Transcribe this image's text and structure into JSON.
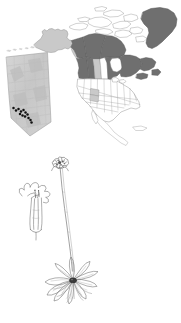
{
  "figure": {
    "background_color": "#ffffff",
    "width": 181,
    "height": 323
  },
  "map": {
    "name": "north-america-distribution-map",
    "projection_note": "North America, Greenland and Arctic archipelago outline",
    "colors": {
      "present_dark": "#6f6f6f",
      "present_mid": "#9a9a9a",
      "present_light": "#c9c9c9",
      "absent_fill": "#ffffff",
      "outline": "#8d8d8d",
      "outline_strong": "#6a6a6a",
      "dot": "#121212"
    },
    "regions": [
      {
        "name": "Greenland",
        "shade": "present_dark"
      },
      {
        "name": "Yukon",
        "shade": "present_dark"
      },
      {
        "name": "Northwest Territories",
        "shade": "present_dark"
      },
      {
        "name": "Nunavut",
        "shade": "present_dark"
      },
      {
        "name": "British Columbia",
        "shade": "present_dark"
      },
      {
        "name": "Alberta",
        "shade": "present_dark"
      },
      {
        "name": "Saskatchewan",
        "shade": "present_light"
      },
      {
        "name": "Manitoba",
        "shade": "absent"
      },
      {
        "name": "Ontario",
        "shade": "present_dark"
      },
      {
        "name": "Quebec",
        "shade": "present_dark"
      },
      {
        "name": "Labrador",
        "shade": "present_dark"
      },
      {
        "name": "Alaska",
        "shade": "present_light"
      },
      {
        "name": "Wyoming",
        "shade": "present_light"
      },
      {
        "name": "Colorado",
        "shade": "present_light"
      },
      {
        "name": "Contiguous United States",
        "shade": "absent"
      },
      {
        "name": "Mexico",
        "shade": "absent"
      }
    ]
  },
  "inset": {
    "name": "alberta-inset-map",
    "region_label": "Alberta",
    "fill": "#cfcfcf",
    "border": "#a0a0a0",
    "dot_color": "#111111",
    "dot_count": 13,
    "dots": [
      {
        "x": 13.5,
        "y": 108.0
      },
      {
        "x": 16.0,
        "y": 110.5
      },
      {
        "x": 18.5,
        "y": 109.0
      },
      {
        "x": 21.0,
        "y": 111.5
      },
      {
        "x": 23.5,
        "y": 110.0
      },
      {
        "x": 25.5,
        "y": 112.5
      },
      {
        "x": 20.0,
        "y": 114.0
      },
      {
        "x": 22.5,
        "y": 115.5
      },
      {
        "x": 25.0,
        "y": 116.5
      },
      {
        "x": 27.5,
        "y": 114.5
      },
      {
        "x": 28.5,
        "y": 118.0
      },
      {
        "x": 30.5,
        "y": 120.0
      },
      {
        "x": 31.5,
        "y": 122.5
      }
    ]
  },
  "illustration": {
    "name": "plant-line-drawing",
    "subject": "rosette herb with leafless scape and single terminal head",
    "line_color": "#6d6d6d",
    "accent_color": "#2a2a2a",
    "parts": [
      {
        "name": "flower-head",
        "label": "terminal flower head"
      },
      {
        "name": "scape",
        "label": "leafless flowering stalk"
      },
      {
        "name": "basal-rosette",
        "label": "basal leaf rosette"
      },
      {
        "name": "roots",
        "label": "fibrous roots"
      },
      {
        "name": "floret-detail",
        "label": "enlarged single floret"
      }
    ]
  }
}
